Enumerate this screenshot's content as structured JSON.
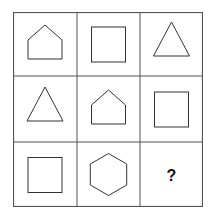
{
  "puzzle": {
    "rows": 3,
    "cols": 3,
    "cells": [
      [
        "pentagon-house",
        "square",
        "triangle"
      ],
      [
        "triangle",
        "pentagon-house",
        "square"
      ],
      [
        "square",
        "hexagon",
        "?"
      ]
    ],
    "missing_label": "?"
  },
  "colors": {
    "stroke": "#333333",
    "grid": "#555555",
    "background": "#ffffff"
  }
}
